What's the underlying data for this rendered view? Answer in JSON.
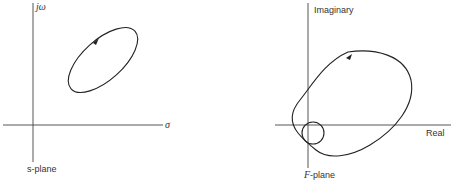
{
  "left_plot": {
    "axis_vertical_label": "jω",
    "axis_horizontal_label": "σ",
    "plane_label": "s-plane",
    "contour": "closed elliptical contour in upper-right quadrant, tilted, with direction arrow at top-left"
  },
  "right_plot": {
    "axis_vertical_label": "Imaginary",
    "axis_horizontal_label": "Real",
    "plane_label_italic": "F",
    "plane_label_rest": "-plane",
    "contour": "large mapped loop encircling origin with small inner loop near origin, direction arrow at top"
  },
  "colors": {
    "stroke": "#222222",
    "background": "#ffffff"
  }
}
